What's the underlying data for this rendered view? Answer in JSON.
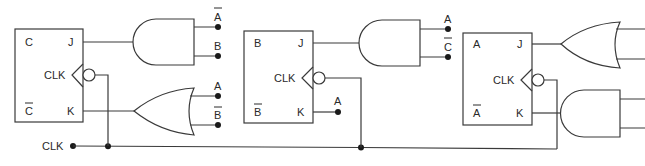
{
  "diagram": {
    "type": "JK flip-flop sequential circuit",
    "clock_input": {
      "label": "CLK"
    },
    "flip_flops": [
      {
        "id": "FF-C",
        "q_label": "C",
        "q_bar_label": "C",
        "q_bar_overline": true,
        "j_label": "J",
        "k_label": "K",
        "clk_label": "CLK",
        "clock_edge": "negative",
        "j_gate": {
          "type": "AND",
          "inputs": [
            {
              "label": "A",
              "overline": true
            },
            {
              "label": "B",
              "overline": false
            }
          ]
        },
        "k_gate": {
          "type": "OR",
          "inputs": [
            {
              "label": "A",
              "overline": false
            },
            {
              "label": "B",
              "overline": true
            }
          ]
        }
      },
      {
        "id": "FF-B",
        "q_label": "B",
        "q_bar_label": "B",
        "q_bar_overline": true,
        "j_label": "J",
        "k_label": "K",
        "clk_label": "CLK",
        "clock_edge": "negative",
        "j_gate": {
          "type": "AND",
          "inputs": [
            {
              "label": "A",
              "overline": false
            },
            {
              "label": "C",
              "overline": true
            }
          ]
        },
        "k_input": {
          "label": "A",
          "overline": false
        }
      },
      {
        "id": "FF-A",
        "q_label": "A",
        "q_bar_label": "A",
        "q_bar_overline": true,
        "j_label": "J",
        "k_label": "K",
        "clk_label": "CLK",
        "clock_edge": "negative",
        "j_gate": {
          "type": "OR",
          "inputs": [
            {
              "label": "",
              "overline": false
            },
            {
              "label": "",
              "overline": false
            }
          ]
        },
        "k_gate": {
          "type": "AND",
          "inputs": [
            {
              "label": "",
              "overline": false
            },
            {
              "label": "",
              "overline": false
            }
          ]
        }
      }
    ]
  }
}
